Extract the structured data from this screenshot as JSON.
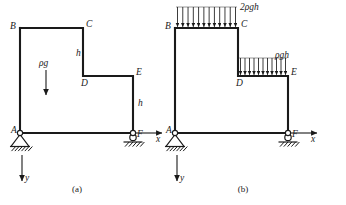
{
  "figure": {
    "type": "engineering-statics-diagram"
  },
  "coordinate_system": {
    "x_axis_label": "x",
    "y_axis_label": "y",
    "x_direction": "right",
    "y_direction": "down"
  },
  "panels": [
    {
      "id": "a",
      "caption": "(a)",
      "caption_x": 77,
      "caption_y": 192,
      "origin_x": 0,
      "nodes": [
        {
          "name": "A",
          "label": "A",
          "x": 20,
          "y": 133,
          "label_dx": -9,
          "label_dy": 0
        },
        {
          "name": "B",
          "label": "B",
          "x": 20,
          "y": 28,
          "label_dx": -10,
          "label_dy": 1
        },
        {
          "name": "C",
          "label": "C",
          "x": 83,
          "y": 28,
          "label_dx": 3,
          "label_dy": -1
        },
        {
          "name": "D",
          "label": "D",
          "x": 83,
          "y": 76,
          "label_dx": -2,
          "label_dy": 10
        },
        {
          "name": "E",
          "label": "E",
          "x": 133,
          "y": 76,
          "label_dx": 3,
          "label_dy": -1
        },
        {
          "name": "F",
          "label": "F",
          "x": 133,
          "y": 133,
          "label_dx": 4,
          "label_dy": 4
        }
      ],
      "dimension_labels": [
        {
          "text": "h",
          "x": 76,
          "y": 56,
          "segment": "C-D"
        },
        {
          "text": "h",
          "x": 138,
          "y": 106,
          "segment": "E-F"
        }
      ],
      "body_force": {
        "label": "ρg",
        "label_x": 39,
        "label_y": 66,
        "arrow_x": 46,
        "arrow_y_start": 70,
        "arrow_y_end": 95
      }
    },
    {
      "id": "b",
      "caption": "(b)",
      "caption_x": 243,
      "caption_y": 192,
      "origin_x": 155,
      "nodes": [
        {
          "name": "A",
          "label": "A",
          "x": 20,
          "y": 133,
          "label_dx": -9,
          "label_dy": 0
        },
        {
          "name": "B",
          "label": "B",
          "x": 20,
          "y": 28,
          "label_dx": -10,
          "label_dy": 1
        },
        {
          "name": "C",
          "label": "C",
          "x": 83,
          "y": 28,
          "label_dx": 3,
          "label_dy": -1
        },
        {
          "name": "D",
          "label": "D",
          "x": 83,
          "y": 76,
          "label_dx": -2,
          "label_dy": 10
        },
        {
          "name": "E",
          "label": "E",
          "x": 133,
          "y": 76,
          "label_dx": 3,
          "label_dy": -1
        },
        {
          "name": "F",
          "label": "F",
          "x": 133,
          "y": 133,
          "label_dx": 4,
          "label_dy": 4
        }
      ],
      "distributed_loads": [
        {
          "name": "load-on-BC",
          "label": "2ρgh",
          "label_x": 85,
          "label_y": 10,
          "x_start": 21,
          "x_end": 82,
          "y_base": 28,
          "height": 21,
          "arrow_count": 12,
          "direction": "down"
        },
        {
          "name": "load-on-DE",
          "label": "ρgh",
          "label_x": 120,
          "label_y": 58,
          "x_start": 84,
          "x_end": 132,
          "y_base": 76,
          "height": 18,
          "arrow_count": 11,
          "direction": "down"
        }
      ]
    }
  ],
  "supports": {
    "pin": {
      "node": "A",
      "type": "pin",
      "width": 18,
      "height": 12
    },
    "roller": {
      "node": "F",
      "type": "roller",
      "radius": 3.2
    }
  },
  "colors": {
    "frame": "#1a1a1a",
    "load_guide": "#777777",
    "background": "#ffffff"
  }
}
